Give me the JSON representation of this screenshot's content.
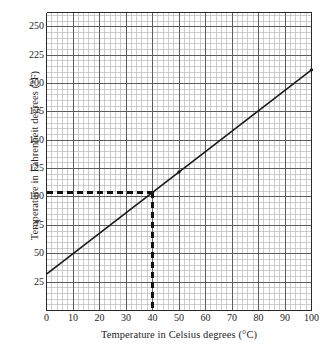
{
  "chart_data": {
    "type": "line",
    "title": "",
    "xlabel": "Temperature in Celsius degrees (°C)",
    "ylabel": "Temperature in Fahrenheit degrees (°F)",
    "xlim": [
      0,
      100
    ],
    "ylim": [
      0,
      262.5
    ],
    "grid": true,
    "grid_minor": true,
    "legend": "none",
    "xticks": [
      0,
      10,
      20,
      30,
      40,
      50,
      60,
      70,
      80,
      90,
      100
    ],
    "xtick_labels": [
      "0",
      "10",
      "20",
      "30",
      "40",
      "50",
      "60",
      "70",
      "80",
      "90",
      "100"
    ],
    "yticks": [
      25,
      50,
      75,
      100,
      125,
      150,
      175,
      200,
      225,
      250
    ],
    "ytick_labels": [
      "25",
      "50",
      "75",
      "100",
      "125",
      "150",
      "175",
      "200",
      "225",
      "250"
    ],
    "series": [
      {
        "name": "Celsius to Fahrenheit conversion",
        "x": [
          0,
          100
        ],
        "values": [
          32,
          212
        ],
        "color": "#1a1a1a"
      }
    ],
    "markers": [
      {
        "x": 50,
        "y": 122
      },
      {
        "x": 100,
        "y": 212
      },
      {
        "x": 40,
        "y": 104
      }
    ],
    "annotations": [
      {
        "name": "guide-line-vertical",
        "style": "dashed",
        "x": 40,
        "y_from": 0,
        "y_to": 104,
        "color": "#111111"
      },
      {
        "name": "guide-line-horizontal",
        "style": "dashed",
        "y": 104,
        "x_from": 0,
        "x_to": 40,
        "color": "#111111"
      }
    ]
  },
  "colors": {
    "background": "#ffffff",
    "minor_grid": "#b9b9b9",
    "major_grid": "#5c5c5c",
    "axis": "#2a2a2a",
    "data_line": "#1a1a1a",
    "guide_line": "#111111",
    "text": "#242424"
  }
}
